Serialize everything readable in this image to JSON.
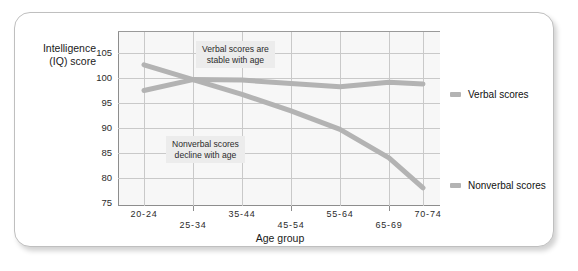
{
  "chart_data": {
    "type": "line",
    "title": "",
    "xlabel": "Age group",
    "ylabel": "Intelligence (IQ) score",
    "ylabel_line1": "Intelligence",
    "ylabel_line2": "(IQ) score",
    "categories": [
      "20-24",
      "25-34",
      "35-44",
      "45-54",
      "55-64",
      "65-69",
      "70-74"
    ],
    "yticks": [
      75,
      80,
      85,
      90,
      95,
      100,
      105
    ],
    "ylim": [
      75,
      107
    ],
    "grid": true,
    "legend_position": "right",
    "series": [
      {
        "name": "Verbal scores",
        "color": "#b3b3b3",
        "values": [
          96.3,
          98.3,
          98.2,
          97.6,
          97.0,
          97.8,
          97.5
        ]
      },
      {
        "name": "Nonverbal scores",
        "color": "#b3b3b3",
        "values": [
          101.0,
          98.3,
          95.6,
          92.6,
          89.2,
          84.0,
          78.5
        ]
      }
    ],
    "annotations": [
      {
        "text_line1": "Verbal scores are",
        "text_line2": "stable with age"
      },
      {
        "text_line1": "Nonverbal scores",
        "text_line2": "decline with age"
      }
    ]
  },
  "legend": {
    "items": [
      {
        "label": "Verbal scores"
      },
      {
        "label": "Nonverbal scores"
      }
    ]
  },
  "ytick_labels": [
    "105",
    "100",
    "95",
    "90",
    "85",
    "80",
    "75"
  ],
  "xtick_labels": [
    "20-24",
    "25-34",
    "35-44",
    "45-54",
    "55-64",
    "65-69",
    "70-74"
  ]
}
